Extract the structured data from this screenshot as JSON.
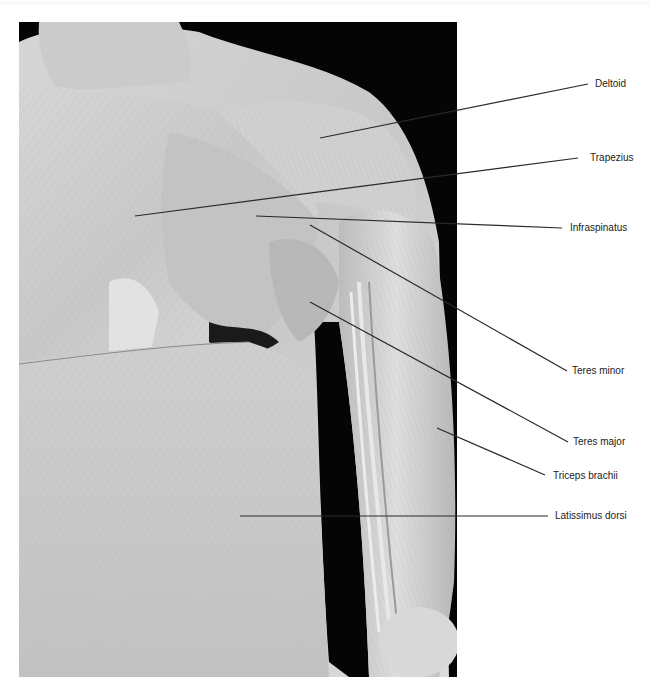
{
  "figure": {
    "type": "anatomical-photograph",
    "colors": {
      "background": "#ffffff",
      "photo_bg": "#000000",
      "line": "#2a2a2a",
      "text": "#222222"
    }
  },
  "labels": [
    {
      "id": "deltoid",
      "text": "Deltoid",
      "x": 595,
      "y": 78,
      "line": [
        320,
        138,
        588,
        84
      ]
    },
    {
      "id": "trapezius",
      "text": "Trapezius",
      "x": 590,
      "y": 152,
      "line": [
        135,
        216,
        578,
        158
      ]
    },
    {
      "id": "infraspinatus",
      "text": "Infraspinatus",
      "x": 570,
      "y": 222,
      "line": [
        256,
        216,
        562,
        228
      ]
    },
    {
      "id": "teres-minor",
      "text": "Teres minor",
      "x": 572,
      "y": 363,
      "line": [
        310,
        225,
        567,
        371
      ]
    },
    {
      "id": "teres-major",
      "text": "Teres major",
      "x": 573,
      "y": 435,
      "line": [
        310,
        302,
        568,
        442
      ]
    },
    {
      "id": "triceps-brachii",
      "text": "Triceps brachii",
      "x": 553,
      "y": 470,
      "line": [
        437,
        428,
        545,
        475
      ]
    },
    {
      "id": "latissimus-dorsi",
      "text": "Latissimus dorsi",
      "x": 555,
      "y": 509,
      "line": [
        240,
        516,
        548,
        516
      ]
    }
  ]
}
